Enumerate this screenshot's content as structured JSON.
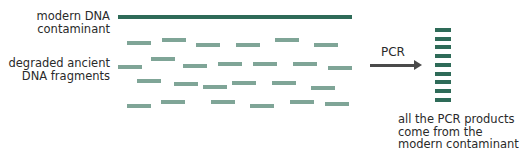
{
  "labels": {
    "modern_line1": "modern DNA",
    "modern_line2": "contaminant",
    "ancient_line1": "degraded ancient",
    "ancient_line2": "DNA fragments"
  },
  "process": {
    "arrow_label": "PCR"
  },
  "result": {
    "line1": "all the PCR products",
    "line2": "come from the",
    "line3": "modern contaminant"
  },
  "colors": {
    "modern_dna": "#2e6b58",
    "ancient_fragment": "#7fa597",
    "arrow": "#4a4a4a"
  },
  "pcr_product_count": 9,
  "ancient_fragment_count": 25
}
